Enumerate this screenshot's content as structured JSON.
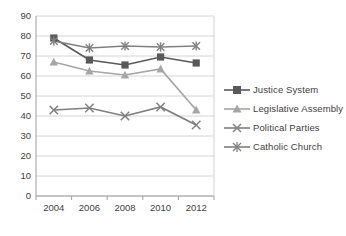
{
  "chart_data": {
    "type": "line",
    "title": "",
    "xlabel": "",
    "ylabel": "",
    "categories": [
      "2004",
      "2006",
      "2008",
      "2010",
      "2012"
    ],
    "x": [
      2004,
      2006,
      2008,
      2010,
      2012
    ],
    "ylim": [
      0,
      90
    ],
    "y_ticks": [
      0,
      10,
      20,
      30,
      40,
      50,
      60,
      70,
      80,
      90
    ],
    "y_tick_labels": [
      "0",
      "10",
      "20",
      "30",
      "40",
      "50",
      "60",
      "70",
      "80",
      "90"
    ],
    "grid": true,
    "legend_position": "right",
    "series": [
      {
        "name": "Justice System",
        "marker": "square",
        "color": "#595959",
        "values": [
          79,
          68,
          65.5,
          69.5,
          66.5
        ]
      },
      {
        "name": "Legislative Assembly",
        "marker": "triangle",
        "color": "#a6a6a6",
        "values": [
          67,
          62.5,
          60.5,
          63.5,
          43
        ]
      },
      {
        "name": "Political Parties",
        "marker": "x",
        "color": "#7f7f7f",
        "values": [
          43,
          44,
          40,
          44.5,
          35.5
        ]
      },
      {
        "name": "Catholic Church",
        "marker": "asterisk",
        "color": "#808080",
        "values": [
          77.5,
          74,
          75,
          74.5,
          75
        ]
      }
    ]
  },
  "legend": {
    "items": [
      {
        "label": "Justice System"
      },
      {
        "label": "Legislative Assembly"
      },
      {
        "label": "Political Parties"
      },
      {
        "label": "Catholic Church"
      }
    ]
  },
  "axes": {
    "y_labels": [
      "90",
      "80",
      "70",
      "60",
      "50",
      "40",
      "30",
      "20",
      "10",
      "0"
    ],
    "x_labels": [
      "2004",
      "2006",
      "2008",
      "2010",
      "2012"
    ]
  },
  "colors": {
    "grid": "#d4d4d4",
    "axis": "#a0a0a0",
    "text": "#404040",
    "series_justice": "#595959",
    "series_legislative": "#a6a6a6",
    "series_political": "#7f7f7f",
    "series_catholic": "#808080"
  }
}
